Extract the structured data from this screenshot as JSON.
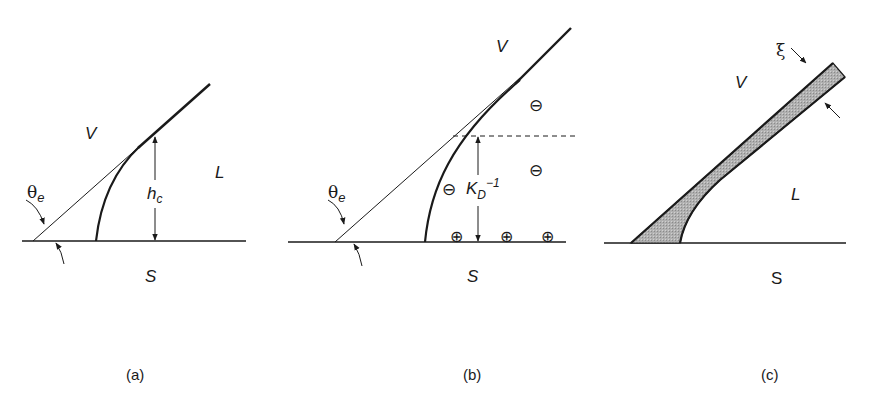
{
  "figure": {
    "panels": [
      {
        "id": "a",
        "caption": "(a)",
        "labels": {
          "vapor": "V",
          "liquid": "L",
          "solid": "S",
          "angle": "θ",
          "angle_sub": "e",
          "height": "h",
          "height_sub": "c"
        },
        "description": "Macroscopic contact line with contact angle θe; microscopic meniscus of height hc"
      },
      {
        "id": "b",
        "caption": "(b)",
        "labels": {
          "vapor": "V",
          "solid": "S",
          "angle": "θ",
          "angle_sub": "e",
          "length": "K",
          "length_sub": "D",
          "length_sup": "−1",
          "neg_charge": "⊖",
          "pos_charge": "⊕"
        },
        "description": "Electrical double layer; Debye length KD^-1 with negative ions in liquid and positive charges on solid"
      },
      {
        "id": "c",
        "caption": "(c)",
        "labels": {
          "vapor": "V",
          "liquid": "L",
          "solid": "S",
          "thickness": "ξ"
        },
        "description": "Interfacial film of thickness ξ along the liquid-vapor interface"
      }
    ],
    "colors": {
      "ink": "#1a1a1a",
      "film_fill": "#a8a8a8",
      "background": "#ffffff"
    }
  }
}
